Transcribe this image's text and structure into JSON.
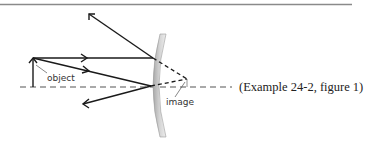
{
  "diagram": {
    "caption": "(Example 24-2, figure 1)",
    "labels": {
      "object": "object",
      "image": "image"
    },
    "colors": {
      "rule": "#8a8a8a",
      "ray": "#1a1a1a",
      "axis": "#555555",
      "mirror_dark": "#9a9a9a",
      "mirror_light": "#dcdcdc"
    },
    "elements": {
      "optical_axis": "dashed horizontal line",
      "object_arrow": "upright arrow",
      "mirror": "convex mirror",
      "rays": [
        {
          "name": "parallel-ray",
          "incident": "horizontal to mirror",
          "reflected": "up-left"
        },
        {
          "name": "center-ray",
          "incident": "downward to mirror vertex",
          "reflected": "down-left"
        }
      ],
      "virtual_extensions": "dashed lines behind mirror to image point"
    }
  }
}
